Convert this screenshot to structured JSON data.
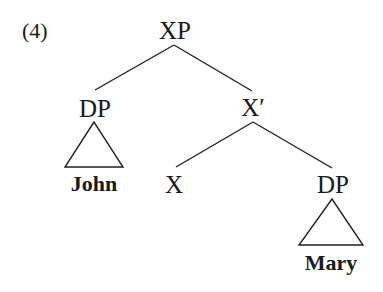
{
  "example_number": "(4)",
  "tree": {
    "root": {
      "label": "XP"
    },
    "spec": {
      "label": "DP",
      "terminal": "John"
    },
    "bar": {
      "label": "X′"
    },
    "head": {
      "label": "X"
    },
    "complement": {
      "label": "DP",
      "terminal": "Mary"
    }
  },
  "colors": {
    "ink": "#1a1a1a",
    "background": "#ffffff"
  }
}
